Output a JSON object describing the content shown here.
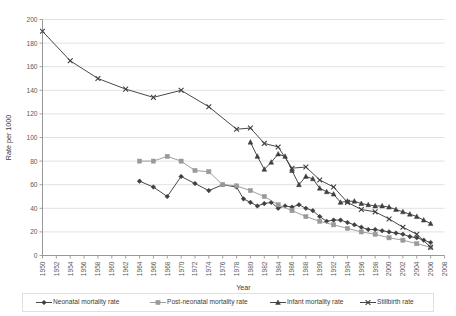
{
  "chart_data": {
    "type": "line",
    "title": "",
    "xlabel": "Year",
    "ylabel": "Rate per 1000",
    "xlim": [
      1950,
      2008
    ],
    "ylim": [
      0,
      200
    ],
    "ytick_step": 20,
    "xtick_step": 2,
    "grid": "horizontal",
    "legend_position": "bottom",
    "yticks": [
      "0",
      "20",
      "40",
      "60",
      "80",
      "100",
      "120",
      "140",
      "160",
      "180",
      "200"
    ],
    "xticks": [
      "1950",
      "1952",
      "1954",
      "1956",
      "1958",
      "1960",
      "1962",
      "1964",
      "1966",
      "1968",
      "1970",
      "1972",
      "1974",
      "1976",
      "1978",
      "1980",
      "1982",
      "1984",
      "1986",
      "1988",
      "1990",
      "1992",
      "1994",
      "1996",
      "1998",
      "2000",
      "2002",
      "2004",
      "2006",
      "2008"
    ],
    "series": [
      {
        "name": "Neonatal mortality rate",
        "marker": "diamond",
        "color": "#3f3f3f",
        "x": [
          1964,
          1966,
          1968,
          1970,
          1972,
          1974,
          1976,
          1978,
          1979,
          1980,
          1981,
          1982,
          1983,
          1984,
          1985,
          1986,
          1987,
          1988,
          1989,
          1990,
          1991,
          1992,
          1993,
          1994,
          1995,
          1996,
          1997,
          1998,
          1999,
          2000,
          2001,
          2002,
          2003,
          2004,
          2005,
          2006
        ],
        "y": [
          63,
          58,
          50,
          67,
          61,
          55,
          60,
          58,
          48,
          45,
          42,
          44,
          45,
          40,
          42,
          41,
          43,
          40,
          38,
          33,
          29,
          30,
          30,
          28,
          26,
          24,
          22,
          22,
          21,
          20,
          19,
          18,
          16,
          15,
          13,
          11
        ]
      },
      {
        "name": "Post-neonatal mortality rate",
        "marker": "square",
        "color": "#9a9a9a",
        "x": [
          1964,
          1966,
          1968,
          1970,
          1972,
          1974,
          1976,
          1978,
          1980,
          1982,
          1984,
          1986,
          1988,
          1990,
          1992,
          1994,
          1996,
          1998,
          2000,
          2002,
          2004,
          2006
        ],
        "y": [
          80,
          80,
          84,
          80,
          72,
          71,
          60,
          59,
          55,
          50,
          43,
          38,
          33,
          29,
          26,
          23,
          20,
          18,
          15,
          13,
          10,
          7
        ]
      },
      {
        "name": "Infant mortality rate",
        "marker": "triangle",
        "color": "#3f3f3f",
        "x": [
          1980,
          1981,
          1982,
          1983,
          1984,
          1985,
          1986,
          1987,
          1988,
          1989,
          1990,
          1991,
          1992,
          1993,
          1994,
          1995,
          1996,
          1997,
          1998,
          1999,
          2000,
          2001,
          2002,
          2003,
          2004,
          2005,
          2006
        ],
        "y": [
          96,
          84,
          73,
          79,
          86,
          84,
          72,
          60,
          67,
          65,
          57,
          54,
          52,
          45,
          46,
          46,
          44,
          43,
          42,
          42,
          41,
          39,
          37,
          35,
          33,
          30,
          27
        ]
      },
      {
        "name": "Stillbirth rate",
        "marker": "cross",
        "color": "#3f3f3f",
        "x": [
          1950,
          1954,
          1958,
          1962,
          1966,
          1970,
          1974,
          1978,
          1980,
          1982,
          1984,
          1986,
          1988,
          1990,
          1992,
          1994,
          1996,
          1998,
          2000,
          2002,
          2004,
          2006
        ],
        "y": [
          190,
          165,
          150,
          141,
          134,
          140,
          126,
          107,
          108,
          95,
          92,
          74,
          75,
          64,
          58,
          45,
          39,
          37,
          31,
          24,
          18,
          7
        ]
      }
    ],
    "legend": [
      "Neonatal mortality rate",
      "Post-neonatal mortality rate",
      "Infant mortality rate",
      "Stillbirth rate"
    ]
  }
}
